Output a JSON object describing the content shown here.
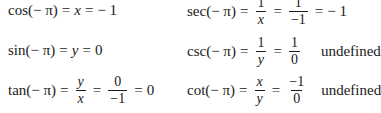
{
  "equations": {
    "cos": {
      "lhs": "cos(− π)",
      "mid": "x",
      "rhs": "− 1"
    },
    "sin": {
      "lhs": "sin(− π)",
      "mid": "y",
      "rhs": "0"
    },
    "tan": {
      "lhs": "tan(− π)",
      "f1_num": "y",
      "f1_den": "x",
      "f2_num": "0",
      "f2_den": "−1",
      "rhs": "0"
    },
    "sec": {
      "lhs": "sec(− π)",
      "f1_num": "1",
      "f1_den": "x",
      "f2_num": "1",
      "f2_den": "−1",
      "rhs": "− 1"
    },
    "csc": {
      "lhs": "csc(− π)",
      "f1_num": "1",
      "f1_den": "y",
      "f2_num": "1",
      "f2_den": "0",
      "note": "undefined"
    },
    "cot": {
      "lhs": "cot(− π)",
      "f1_num": "x",
      "f1_den": "y",
      "f2_num": "−1",
      "f2_den": "0",
      "note": "undefined"
    }
  },
  "symbols": {
    "eq": "="
  }
}
